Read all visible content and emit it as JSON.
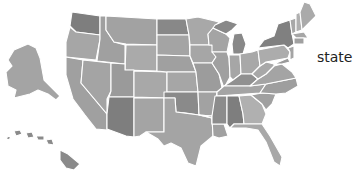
{
  "map": {
    "type": "choropleth",
    "region": "United States",
    "legend": {
      "label": "state"
    },
    "palette": {
      "light": "#b4b4b4",
      "mid": "#a2a2a2",
      "dark": "#8c8c8c",
      "darkest": "#7c7c7c",
      "border": "#ffffff",
      "background": "#ffffff"
    },
    "states": [
      {
        "id": "WA",
        "shade": "#7e7e7e"
      },
      {
        "id": "OR",
        "shade": "#a6a6a6"
      },
      {
        "id": "CA",
        "shade": "#a0a0a0"
      },
      {
        "id": "ID",
        "shade": "#a0a0a0"
      },
      {
        "id": "NV",
        "shade": "#a4a4a4"
      },
      {
        "id": "MT",
        "shade": "#a2a2a2"
      },
      {
        "id": "WY",
        "shade": "#aaaaaa"
      },
      {
        "id": "UT",
        "shade": "#9a9a9a"
      },
      {
        "id": "AZ",
        "shade": "#7e7e7e"
      },
      {
        "id": "CO",
        "shade": "#a8a8a8"
      },
      {
        "id": "NM",
        "shade": "#a4a4a4"
      },
      {
        "id": "ND",
        "shade": "#888888"
      },
      {
        "id": "SD",
        "shade": "#a4a4a4"
      },
      {
        "id": "NE",
        "shade": "#a0a0a0"
      },
      {
        "id": "KS",
        "shade": "#a6a6a6"
      },
      {
        "id": "OK",
        "shade": "#8a8a8a"
      },
      {
        "id": "TX",
        "shade": "#a4a4a4"
      },
      {
        "id": "MN",
        "shade": "#a8a8a8"
      },
      {
        "id": "IA",
        "shade": "#a6a6a6"
      },
      {
        "id": "MO",
        "shade": "#9c9c9c"
      },
      {
        "id": "AR",
        "shade": "#a2a2a2"
      },
      {
        "id": "LA",
        "shade": "#a0a0a0"
      },
      {
        "id": "WI",
        "shade": "#a4a4a4"
      },
      {
        "id": "IL",
        "shade": "#a0a0a0"
      },
      {
        "id": "MI",
        "shade": "#888888"
      },
      {
        "id": "IN",
        "shade": "#a6a6a6"
      },
      {
        "id": "OH",
        "shade": "#a8a8a8"
      },
      {
        "id": "KY",
        "shade": "#909090"
      },
      {
        "id": "TN",
        "shade": "#a4a4a4"
      },
      {
        "id": "MS",
        "shade": "#8c8c8c"
      },
      {
        "id": "AL",
        "shade": "#7e7e7e"
      },
      {
        "id": "GA",
        "shade": "#b0b0b0"
      },
      {
        "id": "FL",
        "shade": "#a8a8a8"
      },
      {
        "id": "SC",
        "shade": "#a0a0a0"
      },
      {
        "id": "NC",
        "shade": "#9e9e9e"
      },
      {
        "id": "VA",
        "shade": "#a4a4a4"
      },
      {
        "id": "WV",
        "shade": "#a8a8a8"
      },
      {
        "id": "PA",
        "shade": "#acacac"
      },
      {
        "id": "NY",
        "shade": "#808080"
      },
      {
        "id": "VT",
        "shade": "#a8a8a8"
      },
      {
        "id": "NH",
        "shade": "#b0b0b0"
      },
      {
        "id": "ME",
        "shade": "#aaaaaa"
      },
      {
        "id": "MA",
        "shade": "#a6a6a6"
      },
      {
        "id": "CT",
        "shade": "#a0a0a0"
      },
      {
        "id": "NJ",
        "shade": "#a4a4a4"
      },
      {
        "id": "MD",
        "shade": "#9a9a9a"
      },
      {
        "id": "AK",
        "shade": "#a4a4a4"
      },
      {
        "id": "HI",
        "shade": "#8a8a8a"
      }
    ]
  }
}
